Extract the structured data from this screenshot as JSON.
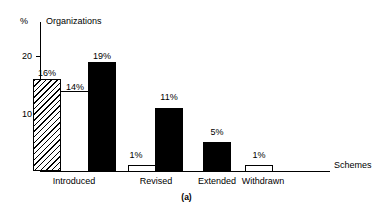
{
  "chart_data": {
    "type": "bar",
    "title": "Organizations",
    "xlabel": "Schemes",
    "ylabel": "%",
    "caption": "(a)",
    "ylim": [
      0,
      24
    ],
    "yticks": [
      10,
      20
    ],
    "ytick_labels": [
      "10",
      "20"
    ],
    "grid": false,
    "legend": "none",
    "categories": [
      "Introduced",
      "Revised",
      "Extended",
      "Withdrawn"
    ],
    "series": [
      {
        "name": "hatched",
        "style": "hatched",
        "values": [
          16,
          null,
          null,
          null
        ]
      },
      {
        "name": "open",
        "style": "open",
        "values": [
          14,
          1,
          null,
          1
        ]
      },
      {
        "name": "solid",
        "style": "solid",
        "values": [
          19,
          11,
          5,
          null
        ]
      }
    ],
    "bars": [
      {
        "category": "Introduced",
        "label": "16%",
        "value": 16,
        "style": "hatched",
        "x": 33,
        "width": 28
      },
      {
        "category": "Introduced",
        "label": "14%",
        "value": 14,
        "style": "open",
        "x": 60,
        "width": 29
      },
      {
        "category": "Introduced",
        "label": "19%",
        "value": 19,
        "style": "solid",
        "x": 88,
        "width": 28
      },
      {
        "category": "Revised",
        "label": "1%",
        "value": 1,
        "style": "open",
        "x": 128,
        "width": 28
      },
      {
        "category": "Revised",
        "label": "11%",
        "value": 11,
        "style": "solid",
        "x": 155,
        "width": 28
      },
      {
        "category": "Extended",
        "label": "5%",
        "value": 5,
        "style": "solid",
        "x": 203,
        "width": 28
      },
      {
        "category": "Withdrawn",
        "label": "1%",
        "value": 1,
        "style": "open",
        "x": 245,
        "width": 28
      }
    ],
    "category_label_positions": [
      {
        "label": "Introduced",
        "center": 74
      },
      {
        "label": "Revised",
        "center": 156
      },
      {
        "label": "Extended",
        "center": 217
      },
      {
        "label": "Withdrawn",
        "center": 263
      }
    ],
    "value_label_positions": [
      {
        "label": "16%",
        "center": 47,
        "top": 68
      },
      {
        "label": "14%",
        "center": 75,
        "top": 82
      },
      {
        "label": "19%",
        "center": 102,
        "top": 51
      },
      {
        "label": "1%",
        "center": 136,
        "top": 150
      },
      {
        "label": "11%",
        "center": 169,
        "top": 92
      },
      {
        "label": "5%",
        "center": 217,
        "top": 127
      },
      {
        "label": "1%",
        "center": 259,
        "top": 150
      }
    ],
    "colors": {
      "axis": "#000000",
      "solid_bar": "#000000",
      "open_bar": "#ffffff",
      "background": "#ffffff",
      "text": "#000000"
    }
  }
}
